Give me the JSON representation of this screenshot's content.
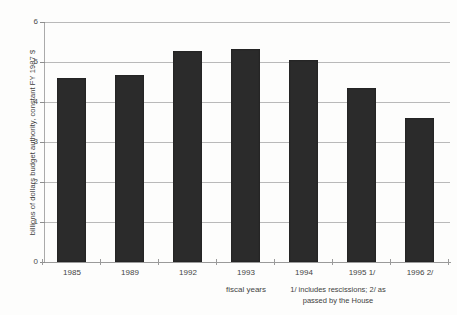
{
  "chart_data": {
    "type": "bar",
    "title": "",
    "subtitle": "",
    "xlabel": "fiscal years",
    "ylabel": "billions of dollars budget authority, constant FY 1987 $",
    "categories": [
      "1985",
      "1989",
      "1992",
      "1993",
      "1994",
      "1995 1/",
      "1996 2/"
    ],
    "values": [
      4.6,
      4.68,
      5.28,
      5.33,
      5.05,
      4.35,
      3.6
    ],
    "ylim": [
      0,
      6
    ],
    "ytick_labels": [
      "6",
      "5",
      "4",
      "3",
      "2",
      "1",
      "0"
    ],
    "ytick_values": [
      6,
      5,
      4,
      3,
      2,
      1,
      0
    ],
    "grid": true,
    "legend": false,
    "legend_position": "none",
    "annotations": [
      "1/ includes rescissions; 2/ as",
      "passed by the House"
    ],
    "bar_color": "#2b2b2b",
    "grid_color": "#b9b9b9",
    "axis_color": "#9a9a9a",
    "background_color": "#fdfdfc"
  },
  "footnote": {
    "line1": "1/ includes rescissions; 2/ as",
    "line2": "passed by the House"
  }
}
